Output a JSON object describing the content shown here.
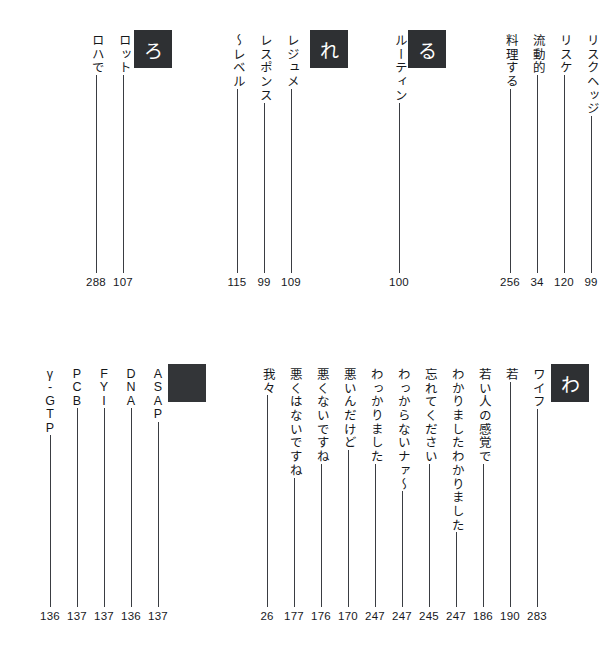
{
  "page": {
    "kind": "japanese-index-page",
    "reading_direction": "vertical-right-to-left",
    "ink_color": "#2e3033",
    "paper_color": "#ffffff"
  },
  "bands": [
    {
      "id": "band-1",
      "sections": [
        {
          "marker": "る",
          "marker_x": 408,
          "entries": [
            {
              "term": "リスクヘッジ",
              "page": "99",
              "x": 578,
              "term_len": 6
            },
            {
              "term": "リスケ",
              "page": "120",
              "x": 551,
              "term_len": 3
            },
            {
              "term": "流動的",
              "page": "34",
              "x": 524,
              "term_len": 3
            },
            {
              "term": "料理する",
              "page": "256",
              "x": 497,
              "term_len": 4
            }
          ]
        },
        {
          "marker": "れ",
          "marker_x": 310,
          "entries": [
            {
              "term": "ルーティン",
              "page": "100",
              "x": 386,
              "term_len": 5
            }
          ]
        },
        {
          "marker": "ろ",
          "marker_x": 134,
          "entries": [
            {
              "term": "レジュメ",
              "page": "109",
              "x": 278,
              "term_len": 4
            },
            {
              "term": "レスポンス",
              "page": "99",
              "x": 251,
              "term_len": 5
            },
            {
              "term": "〜レベル",
              "page": "115",
              "x": 224,
              "term_len": 4
            }
          ]
        },
        {
          "marker": null,
          "entries": [
            {
              "term": "ロット",
              "page": "107",
              "x": 110,
              "term_len": 3
            },
            {
              "term": "ロハで",
              "page": "288",
              "x": 83,
              "term_len": 3
            }
          ]
        }
      ]
    },
    {
      "id": "band-2",
      "sections": [
        {
          "marker": "わ",
          "marker_x": 551,
          "entries": [
            {
              "term": "ワイフ",
              "page": "283",
              "x": 524,
              "term_len": 3
            },
            {
              "term": "若",
              "page": "190",
              "x": 497,
              "term_len": 1
            },
            {
              "term": "若い人の感覚で",
              "page": "186",
              "x": 470,
              "term_len": 7
            },
            {
              "term": "わかりましたわかりました",
              "page": "247",
              "x": 443,
              "term_len": 12
            },
            {
              "term": "忘れてください",
              "page": "245",
              "x": 416,
              "term_len": 7
            },
            {
              "term": "わっからないナァ〜",
              "page": "247",
              "x": 389,
              "term_len": 9
            },
            {
              "term": "わっかりました",
              "page": "247",
              "x": 362,
              "term_len": 7
            },
            {
              "term": "悪いんだけど",
              "page": "170",
              "x": 335,
              "term_len": 6
            },
            {
              "term": "悪くないですね",
              "page": "176",
              "x": 308,
              "term_len": 7
            },
            {
              "term": "悪くはないですね",
              "page": "177",
              "x": 281,
              "term_len": 8
            },
            {
              "term": "我々",
              "page": "26",
              "x": 254,
              "term_len": 2
            }
          ]
        },
        {
          "marker": "",
          "marker_x": 168,
          "marker_blank": true,
          "entries": [
            {
              "term": "ASAP",
              "latin": true,
              "chars": [
                "A",
                "S",
                "A",
                "P"
              ],
              "page": "137",
              "x": 145
            },
            {
              "term": "DNA",
              "latin": true,
              "chars": [
                "D",
                "N",
                "A"
              ],
              "page": "136",
              "x": 118
            },
            {
              "term": "FYI",
              "latin": true,
              "chars": [
                "F",
                "Y",
                "I"
              ],
              "page": "137",
              "x": 91
            },
            {
              "term": "PCB",
              "latin": true,
              "chars": [
                "P",
                "C",
                "B"
              ],
              "page": "137",
              "x": 64
            },
            {
              "term": "γ-GTP",
              "latin": true,
              "chars": [
                "γ",
                "-",
                "G",
                "T",
                "P"
              ],
              "page": "136",
              "x": 37
            }
          ]
        }
      ]
    }
  ]
}
